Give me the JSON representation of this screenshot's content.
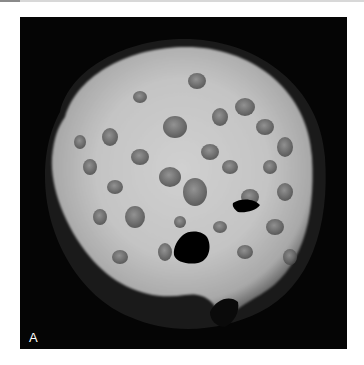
{
  "figure": {
    "panel_label": "A",
    "colors": {
      "background": "#ffffff",
      "frame": "#050505",
      "tissue_light": "#e6e6e6",
      "tissue_mid": "#9a9a9a",
      "cyst_dark": "#5a5a5a"
    }
  }
}
